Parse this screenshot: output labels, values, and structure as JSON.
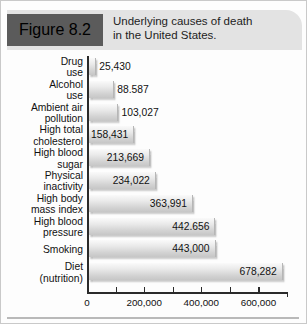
{
  "figure": {
    "badge_label": "Figure 8.2",
    "title_line1": "Underlying causes of death",
    "title_line2": "in the United States."
  },
  "colors": {
    "badge_background": "#5b5b5b",
    "badge_text": "#ffffff",
    "header_background": "#e3e3e3",
    "bar_light": "#fafafa",
    "bar_dark": "#c6c6c6",
    "axis": "#2a2a2a",
    "text": "#111111",
    "border": "#c9c9c9"
  },
  "chart_data": {
    "type": "bar",
    "orientation": "horizontal",
    "title": "Underlying causes of death in the United States.",
    "xlabel": "",
    "ylabel": "",
    "xlim": [
      0,
      700000
    ],
    "grid": false,
    "legend": null,
    "xticks": [
      0,
      200000,
      400000,
      600000
    ],
    "xtick_labels": [
      "0",
      "200,000",
      "400,000",
      "600,000"
    ],
    "categories": [
      "Drug use",
      "Alcohol use",
      "Ambient air pollution",
      "High total cholesterol",
      "High blood sugar",
      "Physical inactivity",
      "High body mass index",
      "High blood pressure",
      "Smoking",
      "Diet (nutrition)"
    ],
    "category_lines": [
      [
        "Drug",
        "use"
      ],
      [
        "Alcohol",
        "use"
      ],
      [
        "Ambient air",
        "pollution"
      ],
      [
        "High total",
        "cholesterol"
      ],
      [
        "High blood",
        "sugar"
      ],
      [
        "Physical",
        "inactivity"
      ],
      [
        "High body",
        "mass index"
      ],
      [
        "High blood",
        "pressure"
      ],
      [
        "Smoking"
      ],
      [
        "Diet",
        "(nutrition)"
      ]
    ],
    "values": [
      25430,
      88587,
      103027,
      158431,
      213669,
      234022,
      363991,
      442656,
      443000,
      678282
    ],
    "value_labels": [
      "25,430",
      "88.587",
      "103,027",
      "158,431",
      "213,669",
      "234,022",
      "363,991",
      "442.656",
      "443,000",
      "678,282"
    ],
    "label_placement": [
      "outside",
      "outside",
      "outside",
      "inside",
      "inside",
      "inside",
      "inside",
      "inside",
      "inside",
      "inside"
    ]
  }
}
